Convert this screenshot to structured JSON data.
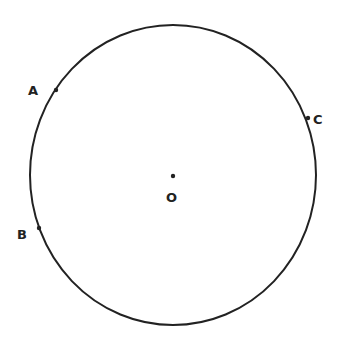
{
  "diagram": {
    "type": "circle-with-points",
    "circle": {
      "cx": 173,
      "cy": 175,
      "rx": 143,
      "ry": 150,
      "stroke": "#222222"
    },
    "center": {
      "label": "O",
      "x": 173,
      "y": 176
    },
    "points": [
      {
        "label": "A",
        "x": 56,
        "y": 90
      },
      {
        "label": "B",
        "x": 39,
        "y": 228
      },
      {
        "label": "C",
        "x": 308,
        "y": 118
      }
    ]
  }
}
